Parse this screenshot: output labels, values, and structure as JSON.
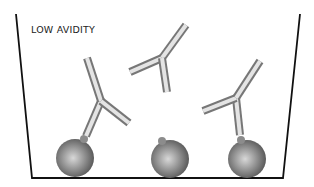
{
  "diagram": {
    "label": "LOW AVIDITY",
    "colors": {
      "outline": "#111111",
      "antibody_light": "#e8e8e8",
      "antibody_dark": "#8a8a8a",
      "antigen_light": "#d6d6d6",
      "antigen_dark": "#555555"
    },
    "container": "well",
    "antibodies": [
      {
        "id": "antibody-left",
        "state": "bound",
        "bound_to": "antigen-left"
      },
      {
        "id": "antibody-top",
        "state": "free"
      },
      {
        "id": "antibody-right",
        "state": "bound",
        "bound_to": "antigen-right"
      }
    ],
    "antigens": [
      {
        "id": "antigen-left",
        "state": "bound"
      },
      {
        "id": "antigen-middle",
        "state": "unbound"
      },
      {
        "id": "antigen-right",
        "state": "bound"
      }
    ]
  }
}
